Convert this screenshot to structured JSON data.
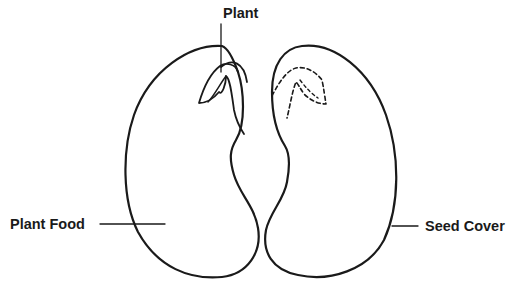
{
  "diagram": {
    "type": "labeled illustration",
    "labels": {
      "plant": "Plant",
      "plant_food": "Plant Food",
      "seed_cover": "Seed Cover"
    },
    "parts": [
      {
        "name": "left-seed-half",
        "shows": "embryo plant (solid outline)"
      },
      {
        "name": "right-seed-half",
        "shows": "embryo plant imprint (dashed outline)"
      }
    ],
    "colors": {
      "line": "#1a1a1a",
      "background": "#ffffff"
    }
  }
}
